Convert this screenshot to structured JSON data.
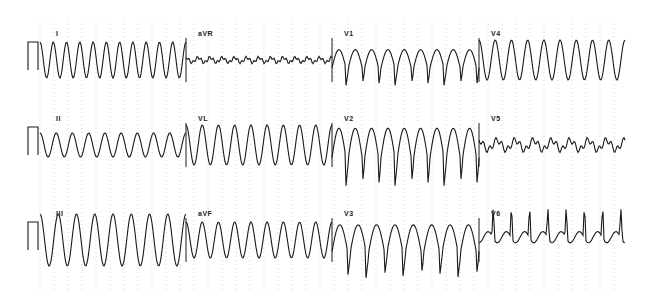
{
  "ecg": {
    "layout": "3x4 standard 12-lead",
    "trace_color": "#1a1a1a",
    "grid_color": "#bdbdbd",
    "calibration_pulse": true,
    "rows": [
      {
        "baseline_y": 60,
        "leads": [
          {
            "label": "I",
            "x0": 40,
            "x1": 186,
            "amp": 18,
            "beats": 11,
            "shape": "sine"
          },
          {
            "label": "aVR",
            "x0": 186,
            "x1": 332,
            "amp": 4,
            "beats": 12,
            "shape": "low"
          },
          {
            "label": "V1",
            "x0": 332,
            "x1": 479,
            "amp": 26,
            "beats": 9,
            "shape": "deepS"
          },
          {
            "label": "V4",
            "x0": 479,
            "x1": 625,
            "amp": 20,
            "beats": 9,
            "shape": "sine"
          }
        ]
      },
      {
        "baseline_y": 145,
        "leads": [
          {
            "label": "II",
            "x0": 40,
            "x1": 186,
            "amp": 12,
            "beats": 9,
            "shape": "sine"
          },
          {
            "label": "VL",
            "x0": 186,
            "x1": 332,
            "amp": 20,
            "beats": 9,
            "shape": "sine"
          },
          {
            "label": "V2",
            "x0": 332,
            "x1": 479,
            "amp": 42,
            "beats": 9,
            "shape": "deepS"
          },
          {
            "label": "V5",
            "x0": 479,
            "x1": 625,
            "amp": 8,
            "beats": 8,
            "shape": "low"
          }
        ]
      },
      {
        "baseline_y": 240,
        "leads": [
          {
            "label": "III",
            "x0": 40,
            "x1": 186,
            "amp": 26,
            "beats": 8,
            "shape": "sine"
          },
          {
            "label": "aVF",
            "x0": 186,
            "x1": 332,
            "amp": 18,
            "beats": 9,
            "shape": "sine"
          },
          {
            "label": "V3",
            "x0": 332,
            "x1": 479,
            "amp": 38,
            "beats": 8,
            "shape": "deepS"
          },
          {
            "label": "V6",
            "x0": 479,
            "x1": 625,
            "amp": 14,
            "beats": 8,
            "shape": "spike"
          }
        ]
      }
    ]
  }
}
